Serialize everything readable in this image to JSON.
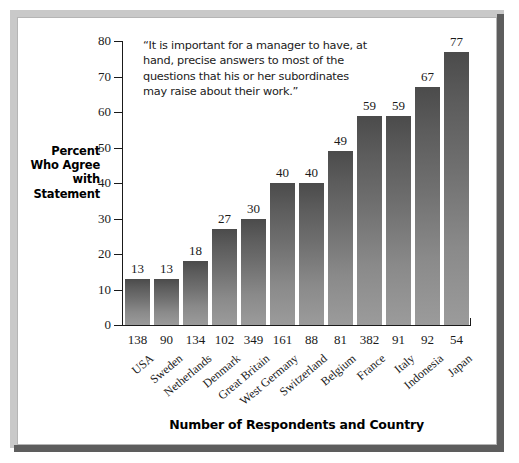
{
  "chart_data": {
    "type": "bar",
    "title": "",
    "annotation": "“It is important for a manager to have, at hand, precise answers to most of the questions that his or her subordinates may raise about their work.”",
    "ylabel": "Percent Who Agree with Statement",
    "xlabel": "Number of Respondents and Country",
    "ylim": [
      0,
      80
    ],
    "yticks": [
      0,
      10,
      20,
      30,
      40,
      50,
      60,
      70,
      80
    ],
    "grid": false,
    "legend": null,
    "categories": [
      "USA",
      "Sweden",
      "Netherlands",
      "Denmark",
      "Great Britain",
      "West Germany",
      "Switzerland",
      "Belgium",
      "France",
      "Italy",
      "Indonesia",
      "Japan"
    ],
    "values": [
      13,
      13,
      18,
      27,
      30,
      40,
      40,
      49,
      59,
      59,
      67,
      77
    ],
    "respondents": [
      138,
      90,
      134,
      102,
      349,
      161,
      88,
      81,
      382,
      91,
      92,
      54
    ],
    "bar_color_top": "#4b4b4b",
    "bar_color_bottom": "#9b9b9b"
  },
  "frame": {
    "border_light": "#c9c9c9",
    "border_dark": "#5d5d5d"
  }
}
